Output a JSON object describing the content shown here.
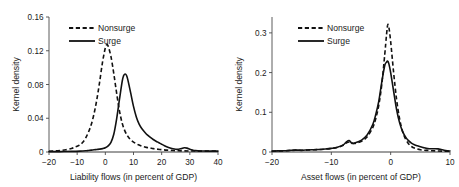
{
  "figure": {
    "background_color": "#ffffff",
    "line_color": "#111111",
    "axis_color": "#4a4a4a",
    "panel_count": 2
  },
  "chart_data": [
    {
      "type": "line",
      "panel": "left",
      "title": "",
      "xlabel": "Liability flows (in percent of GDP)",
      "ylabel": "Kernel density",
      "xlim": [
        -20,
        40
      ],
      "ylim": [
        0,
        0.16
      ],
      "xticks": [
        -20,
        -10,
        0,
        10,
        20,
        30,
        40
      ],
      "xtick_labels": [
        "−20",
        "−10",
        "0",
        "10",
        "20",
        "30",
        "40"
      ],
      "yticks": [
        0,
        0.04,
        0.08,
        0.12,
        0.16
      ],
      "ytick_labels": [
        "0",
        "0.04",
        "0.08",
        "0.12",
        "0.16"
      ],
      "grid": false,
      "legend_position": "top-left",
      "legend": [
        "Nonsurge",
        "Surge"
      ],
      "series": [
        {
          "name": "Nonsurge",
          "style": "dashed",
          "x": [
            -20,
            -18,
            -16,
            -14,
            -12,
            -11,
            -10,
            -9,
            -8,
            -7,
            -6,
            -5,
            -4,
            -3,
            -2,
            -1,
            0,
            0.5,
            1,
            2,
            3,
            4,
            5,
            6,
            7,
            8,
            9,
            10,
            11,
            12,
            13,
            14,
            15,
            16,
            17,
            18,
            20,
            22,
            24,
            26,
            28,
            30,
            32,
            35,
            40
          ],
          "y": [
            0.0008,
            0.0012,
            0.0018,
            0.0026,
            0.0042,
            0.0055,
            0.0068,
            0.0085,
            0.0115,
            0.0165,
            0.0235,
            0.0325,
            0.0455,
            0.0625,
            0.0835,
            0.1065,
            0.1235,
            0.127,
            0.1255,
            0.113,
            0.093,
            0.07,
            0.049,
            0.034,
            0.0245,
            0.0185,
            0.0145,
            0.0118,
            0.0098,
            0.0082,
            0.007,
            0.006,
            0.0052,
            0.0046,
            0.004,
            0.0035,
            0.0028,
            0.0022,
            0.0018,
            0.0015,
            0.0013,
            0.0012,
            0.0011,
            0.001,
            0.001
          ]
        },
        {
          "name": "Surge",
          "style": "solid",
          "x": [
            -20,
            -16,
            -12,
            -9,
            -7,
            -6,
            -5,
            -4,
            -3,
            -2,
            -1,
            0,
            1,
            2,
            3,
            4,
            5,
            6,
            6.5,
            7,
            7.5,
            8,
            9,
            10,
            11,
            12,
            13,
            14,
            15,
            16,
            17,
            18,
            19,
            20,
            21,
            22,
            23,
            24,
            25,
            26,
            27,
            28,
            29,
            30,
            31,
            32,
            34,
            36,
            38,
            40
          ],
          "y": [
            0.0004,
            0.0005,
            0.0007,
            0.001,
            0.0014,
            0.0018,
            0.0022,
            0.0026,
            0.003,
            0.0034,
            0.004,
            0.005,
            0.0072,
            0.0115,
            0.021,
            0.039,
            0.062,
            0.084,
            0.0905,
            0.0925,
            0.091,
            0.0855,
            0.07,
            0.054,
            0.0415,
            0.033,
            0.0275,
            0.0235,
            0.02,
            0.0172,
            0.0148,
            0.0128,
            0.011,
            0.0092,
            0.0075,
            0.006,
            0.0048,
            0.0038,
            0.0032,
            0.0032,
            0.004,
            0.005,
            0.0046,
            0.0032,
            0.0022,
            0.0016,
            0.0012,
            0.0011,
            0.001,
            0.001
          ]
        }
      ]
    },
    {
      "type": "line",
      "panel": "right",
      "title": "",
      "xlabel": "Asset flows (in percent of GDP)",
      "ylabel": "Kernel density",
      "xlim": [
        -20,
        10
      ],
      "ylim": [
        0,
        0.34
      ],
      "xticks": [
        -20,
        -10,
        0,
        10
      ],
      "xtick_labels": [
        "−20",
        "−10",
        "0",
        "10"
      ],
      "yticks": [
        0,
        0.1,
        0.2,
        0.3
      ],
      "ytick_labels": [
        "0",
        "0.1",
        "0.2",
        "0.3"
      ],
      "grid": false,
      "legend_position": "top-left",
      "legend": [
        "Nonsurge",
        "Surge"
      ],
      "series": [
        {
          "name": "Nonsurge",
          "style": "dashed",
          "x": [
            -20,
            -18,
            -17,
            -16,
            -15,
            -14,
            -13,
            -12,
            -11,
            -10,
            -9,
            -8,
            -7.5,
            -7,
            -6.5,
            -6,
            -5,
            -4,
            -3,
            -2.5,
            -2,
            -1.5,
            -1,
            -0.7,
            -0.5,
            -0.3,
            0,
            0.5,
            1,
            1.5,
            2,
            2.5,
            3,
            3.5,
            4,
            5,
            6,
            7,
            8,
            9,
            10
          ],
          "y": [
            0.002,
            0.003,
            0.0038,
            0.0046,
            0.0042,
            0.005,
            0.0056,
            0.0062,
            0.0072,
            0.0088,
            0.0115,
            0.017,
            0.0225,
            0.025,
            0.023,
            0.0215,
            0.0265,
            0.0375,
            0.062,
            0.085,
            0.118,
            0.17,
            0.245,
            0.295,
            0.32,
            0.314,
            0.278,
            0.2,
            0.132,
            0.084,
            0.052,
            0.033,
            0.021,
            0.014,
            0.0098,
            0.0058,
            0.004,
            0.0032,
            0.0026,
            0.0022,
            0.002
          ]
        },
        {
          "name": "Surge",
          "style": "solid",
          "x": [
            -20,
            -18,
            -17,
            -16,
            -15,
            -14,
            -13,
            -12,
            -11,
            -10,
            -9,
            -8,
            -7.5,
            -7,
            -6.5,
            -6,
            -5,
            -4,
            -3,
            -2.5,
            -2,
            -1.5,
            -1,
            -0.7,
            -0.5,
            -0.3,
            0,
            0.5,
            1,
            1.5,
            2,
            2.5,
            3,
            3.5,
            4,
            4.5,
            5,
            5.5,
            6,
            6.5,
            7,
            7.5,
            8,
            8.5,
            9,
            9.5,
            10
          ],
          "y": [
            0.0022,
            0.0032,
            0.004,
            0.0048,
            0.0044,
            0.0052,
            0.0058,
            0.0064,
            0.0075,
            0.0092,
            0.012,
            0.018,
            0.025,
            0.029,
            0.0215,
            0.023,
            0.029,
            0.042,
            0.07,
            0.095,
            0.128,
            0.176,
            0.218,
            0.226,
            0.229,
            0.222,
            0.2,
            0.153,
            0.107,
            0.074,
            0.052,
            0.038,
            0.0285,
            0.0225,
            0.0185,
            0.0155,
            0.013,
            0.011,
            0.0092,
            0.0082,
            0.008,
            0.0082,
            0.0078,
            0.0062,
            0.0045,
            0.0032,
            0.0026
          ]
        }
      ]
    }
  ]
}
